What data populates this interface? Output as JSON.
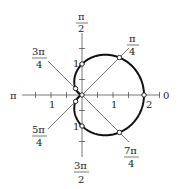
{
  "chart_data": {
    "type": "line",
    "coordinate_system": "polar",
    "title": "",
    "equation": "r = 1 + cos(theta)",
    "curve_name": "cardioid",
    "axes": {
      "radial_ticks_step": 0.5,
      "radial_tick_labels": [
        "1",
        "2"
      ],
      "angle_labels": [
        {
          "angle": "0",
          "label": "0"
        },
        {
          "angle": "pi/4",
          "num": "π",
          "den": "4"
        },
        {
          "angle": "pi/2",
          "num": "π",
          "den": "2"
        },
        {
          "angle": "3pi/4",
          "num": "3π",
          "den": "4"
        },
        {
          "angle": "pi",
          "label": "π"
        },
        {
          "angle": "5pi/4",
          "num": "5π",
          "den": "4"
        },
        {
          "angle": "3pi/2",
          "num": "3π",
          "den": "2"
        },
        {
          "angle": "7pi/4",
          "num": "7π",
          "den": "4"
        }
      ]
    },
    "marked_points": [
      {
        "theta": "0",
        "r": 2
      },
      {
        "theta": "pi/4",
        "r": 1.707
      },
      {
        "theta": "pi/2",
        "r": 1
      },
      {
        "theta": "3pi/4",
        "r": 0.293
      },
      {
        "theta": "pi",
        "r": 0
      },
      {
        "theta": "5pi/4",
        "r": 0.293
      },
      {
        "theta": "3pi/2",
        "r": 1
      },
      {
        "theta": "7pi/4",
        "r": 1.707
      }
    ],
    "labels": {
      "zero": "0",
      "pi": "π",
      "r1_x": "1",
      "r1_neg_x": "1",
      "r1_y": "1",
      "r1_neg_y": "1",
      "r2_x": "2"
    }
  }
}
